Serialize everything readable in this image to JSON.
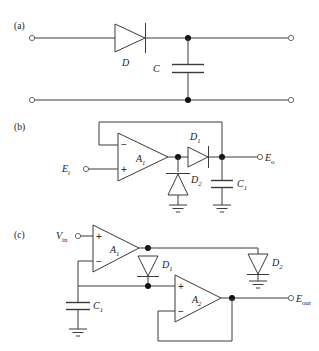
{
  "figure": {
    "background_color": "#ffffff",
    "line_color": "#3a3a3a"
  },
  "panels": [
    {
      "id": "a",
      "label": "(a)",
      "description": "Passive diode-capacitor peak detector",
      "components": [
        {
          "name": "diode",
          "label": "D",
          "type": "diode"
        },
        {
          "name": "capacitor",
          "label": "C",
          "type": "capacitor"
        }
      ],
      "terminals": [
        {
          "name": "input-top",
          "label": ""
        },
        {
          "name": "input-bottom",
          "label": ""
        },
        {
          "name": "output-top",
          "label": ""
        },
        {
          "name": "output-bottom",
          "label": ""
        }
      ]
    },
    {
      "id": "b",
      "label": "(b)",
      "description": "Op-amp peak detector with feedback from output",
      "components": [
        {
          "name": "opamp",
          "label": "A",
          "subscript": "1",
          "type": "opamp"
        },
        {
          "name": "diode-series",
          "label": "D",
          "subscript": "1",
          "type": "diode"
        },
        {
          "name": "diode-shunt",
          "label": "D",
          "subscript": "2",
          "type": "zener"
        },
        {
          "name": "capacitor-hold",
          "label": "C",
          "subscript": "1",
          "type": "capacitor"
        }
      ],
      "terminals": [
        {
          "name": "input",
          "label": "E",
          "subscript": "i"
        },
        {
          "name": "output",
          "label": "E",
          "subscript": "o"
        }
      ],
      "opamp_signs": {
        "inverting": "−",
        "noninverting": "+"
      }
    },
    {
      "id": "c",
      "label": "(c)",
      "description": "Two op-amp buffered peak detector",
      "components": [
        {
          "name": "opamp-first",
          "label": "A",
          "subscript": "1",
          "type": "opamp"
        },
        {
          "name": "opamp-second",
          "label": "A",
          "subscript": "2",
          "type": "opamp"
        },
        {
          "name": "diode-first",
          "label": "D",
          "subscript": "1",
          "type": "diode"
        },
        {
          "name": "diode-second",
          "label": "D",
          "subscript": "2",
          "type": "diode"
        },
        {
          "name": "capacitor-hold",
          "label": "C",
          "subscript": "1",
          "type": "capacitor"
        }
      ],
      "terminals": [
        {
          "name": "input",
          "label": "V",
          "subscript": "in"
        },
        {
          "name": "output",
          "label": "E",
          "subscript": "out"
        }
      ],
      "opamp_signs": {
        "inverting": "−",
        "noninverting": "+"
      }
    }
  ]
}
